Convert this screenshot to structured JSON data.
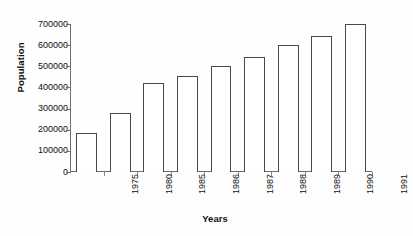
{
  "chart_data": {
    "type": "bar",
    "title": "",
    "xlabel": "Years",
    "ylabel": "Population",
    "categories": [
      "1975",
      "1980",
      "1985",
      "1986",
      "1987",
      "1988",
      "1989",
      "1990",
      "1991"
    ],
    "values": [
      185000,
      277000,
      422000,
      455000,
      500000,
      545000,
      600000,
      645000,
      700000
    ],
    "ylim": [
      0,
      700000
    ],
    "yticks": [
      0,
      100000,
      200000,
      300000,
      400000,
      500000,
      600000,
      700000
    ],
    "ytick_labels": [
      "0",
      "100000",
      "200000",
      "300000",
      "400000",
      "500000",
      "600000",
      "700000"
    ],
    "grid": false,
    "legend": false,
    "bar_fill_color": "#ffffff",
    "bar_edge_color": "#4a4a4a",
    "axis_color": "#6e6e6e",
    "background_color": "#fefefe"
  },
  "annotations": {
    "margin_notes": [
      {
        "text": "800k",
        "position": "top-right"
      },
      {
        "text": "Zyprexa mmg cap/x",
        "position": "middle-right"
      },
      {
        "text": "1974",
        "position": "bottom-right"
      }
    ]
  }
}
